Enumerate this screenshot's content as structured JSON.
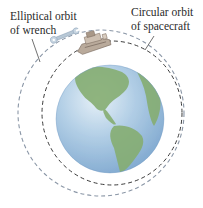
{
  "figure": {
    "labels": {
      "wrench": {
        "line1": "Elliptical orbit",
        "line2": "of wrench"
      },
      "spacecraft": {
        "line1": "Circular orbit",
        "line2": "of spacecraft"
      }
    },
    "objects": {
      "earth": "earth-globe",
      "spacecraft": "space-shuttle",
      "wrench": "wrench"
    },
    "colors": {
      "background": "#ffffff",
      "ocean": "#8fb6d8",
      "ocean_highlight": "#d9e8f3",
      "land": "#7fa66a",
      "elliptical_orbit": "#8a96a6",
      "circular_orbit": "#3a3a3a",
      "label_text": "#2a2a2a"
    }
  }
}
